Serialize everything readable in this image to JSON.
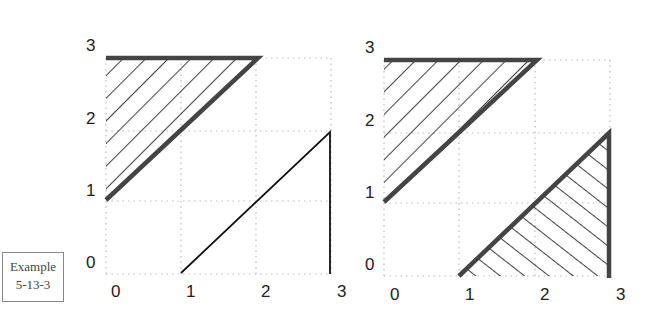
{
  "example_label": {
    "line1": "Example",
    "line2": "5-13-3"
  },
  "panels": [
    {
      "x_ticks": [
        "0",
        "1",
        "2",
        "3"
      ],
      "y_ticks": [
        "0",
        "1",
        "2",
        "3"
      ],
      "hatched_regions": [
        "upper-left triangle (0,0.9)-(0,2.9)-(1.95,2.9)"
      ],
      "lines": [
        "diagonal (0.95,0)-(2.95,1.9)",
        "vertical x=2.95 from 0 to 1.9"
      ]
    },
    {
      "x_ticks": [
        "0",
        "1",
        "2",
        "3"
      ],
      "y_ticks": [
        "0",
        "1",
        "2",
        "3"
      ],
      "hatched_regions": [
        "upper-left triangle (0,0.9)-(0,2.9)-(1.95,2.9)",
        "lower-right triangle (0.95,0)-(2.95,0)-(2.95,1.9)"
      ]
    }
  ],
  "colors": {
    "thick_line": "#444444",
    "thin_line": "#111111",
    "grid": "#bbbbbb"
  }
}
